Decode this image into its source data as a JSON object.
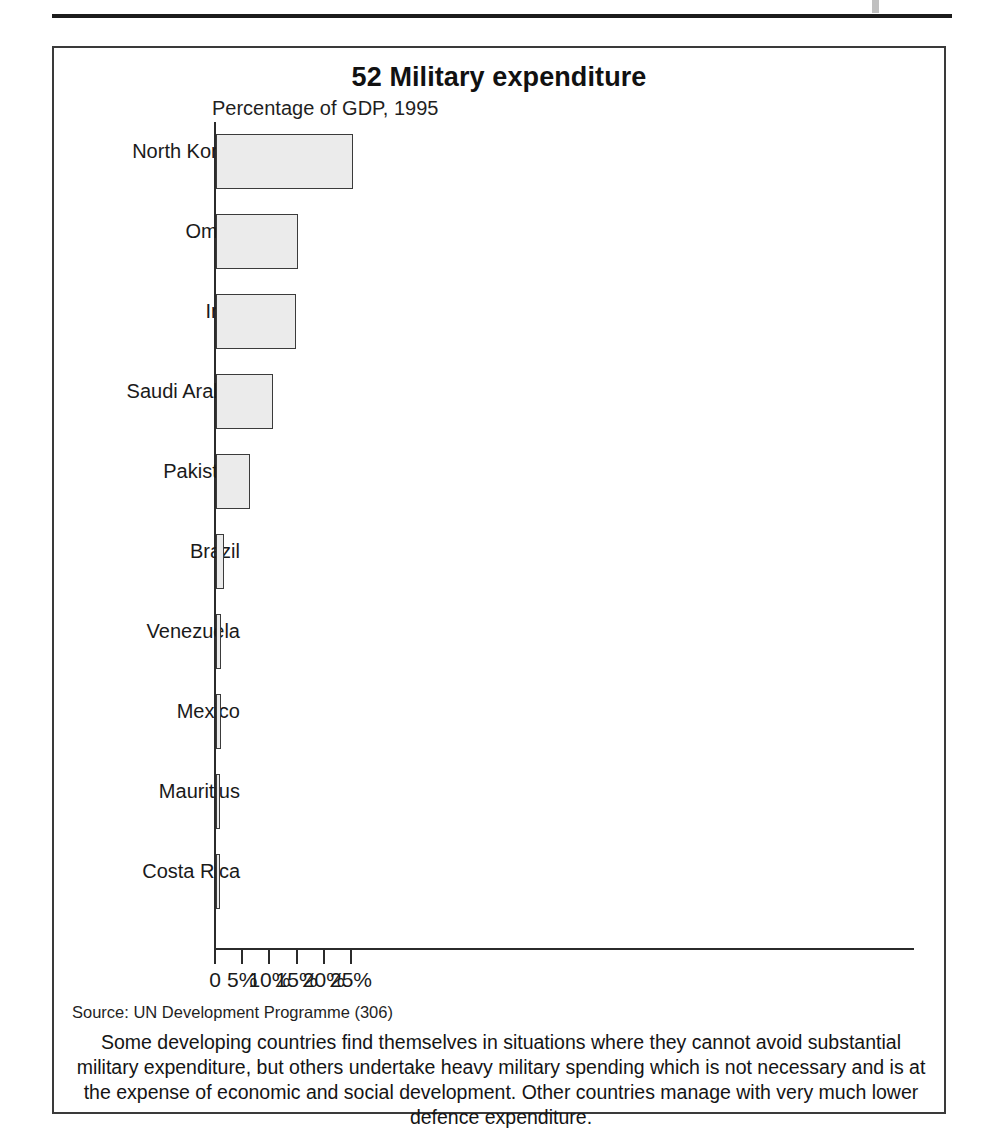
{
  "figure": {
    "number_and_title": "52 Military expenditure",
    "subtitle": "Percentage of GDP, 1995",
    "source": "Source: UN Development Programme (306)",
    "caption": "Some developing countries find themselves in situations where they cannot avoid substantial military expenditure, but others undertake heavy military spending which is not necessary and is at the expense of economic and social development. Other countries manage with very much lower defence expenditure.",
    "frame_color": "#3a3a3a",
    "bar_fill_color": "#ebebeb",
    "bar_border_color": "#3b3b3b"
  },
  "chart_data": {
    "type": "bar",
    "orientation": "horizontal",
    "title": "52 Military expenditure",
    "subtitle": "Percentage of GDP, 1995",
    "xlabel": "",
    "ylabel": "",
    "xlim": [
      0,
      25.8
    ],
    "grid": false,
    "legend": null,
    "xticks": [
      0,
      5,
      10,
      15,
      20,
      25
    ],
    "xtick_labels": [
      "0",
      "5%",
      "10%",
      "15%",
      "20%",
      "25%"
    ],
    "categories": [
      "North Korea",
      "Oman",
      "Iraq",
      "Saudi Arabia",
      "Pakistan",
      "Brazil",
      "Venezuela",
      "Mexico",
      "Mauritius",
      "Costa Rica"
    ],
    "values": [
      25.2,
      15.0,
      14.7,
      10.5,
      6.2,
      1.4,
      1.0,
      0.9,
      0.45,
      0.3
    ],
    "units": "percent of GDP"
  }
}
